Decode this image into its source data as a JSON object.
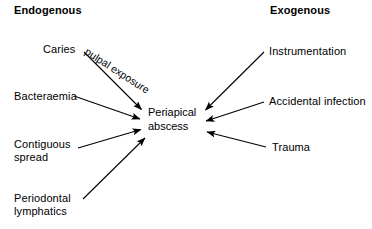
{
  "diagram": {
    "background_color": "#ffffff",
    "line_color": "#000000",
    "text_color": "#000000",
    "center_node": {
      "line1": "Periapical",
      "line2": "abscess"
    },
    "headings": [
      {
        "id": "endogenous",
        "label": "Endogenous",
        "side": "left"
      },
      {
        "id": "exogenous",
        "label": "Exogenous",
        "side": "right"
      }
    ],
    "sources": [
      {
        "id": "caries",
        "label": "Caries",
        "label2": "",
        "side": "left",
        "edge_label": "pulpal exposure"
      },
      {
        "id": "bacteraemia",
        "label": "Bacteraemia",
        "label2": "",
        "side": "left",
        "edge_label": ""
      },
      {
        "id": "contiguous-spread",
        "label": "Contiguous",
        "label2": "spread",
        "side": "left",
        "edge_label": ""
      },
      {
        "id": "periodontal-lymphatics",
        "label": "Periodontal",
        "label2": "lymphatics",
        "side": "left",
        "edge_label": ""
      },
      {
        "id": "instrumentation",
        "label": "Instrumentation",
        "label2": "",
        "side": "right",
        "edge_label": ""
      },
      {
        "id": "accidental-infection",
        "label": "Accidental infection",
        "label2": "",
        "side": "right",
        "edge_label": ""
      },
      {
        "id": "trauma",
        "label": "Trauma",
        "label2": "",
        "side": "right",
        "edge_label": ""
      }
    ]
  }
}
